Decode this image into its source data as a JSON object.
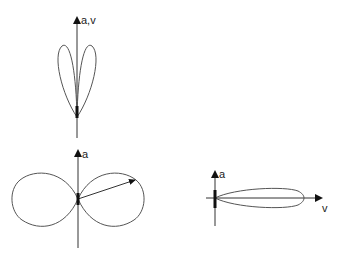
{
  "figures": [
    {
      "id": "top",
      "axis_label": "a,v",
      "description": "two-lobed radiation pattern tilted forward along parallel a,v axis"
    },
    {
      "id": "bottom-left",
      "axis_label": "a",
      "description": "dipole donut radiation pattern perpendicular to acceleration"
    },
    {
      "id": "bottom-right",
      "axis_label_vertical": "a",
      "axis_label_horizontal": "v",
      "description": "forward beamed narrow lobe along velocity"
    }
  ],
  "colors": {
    "line": "#555555",
    "axis": "#333333",
    "charge": "#111111"
  }
}
